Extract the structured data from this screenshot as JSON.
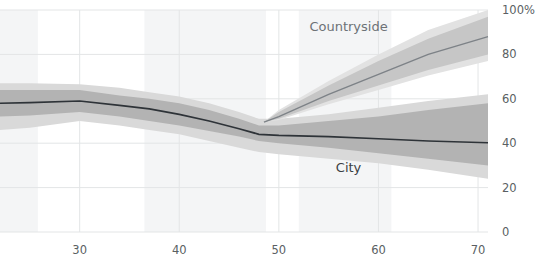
{
  "chart_data": {
    "type": "line",
    "title": "",
    "subtitle": "",
    "xlabel": "",
    "ylabel": "",
    "xlim": [
      22,
      71
    ],
    "ylim": [
      0,
      100
    ],
    "y_unit": "%",
    "grid": true,
    "legend_position": "inline-annotation",
    "x_ticks": [
      30,
      40,
      50,
      60,
      70
    ],
    "x_tick_labels": [
      "30",
      "40",
      "50",
      "60",
      "70"
    ],
    "y_ticks": [
      0,
      20,
      40,
      60,
      80,
      100
    ],
    "y_tick_labels": [
      "0",
      "20",
      "40",
      "60",
      "80",
      "100%"
    ],
    "background_bands": [
      {
        "x0": 22,
        "x1": 25.8
      },
      {
        "x0": 36.5,
        "x1": 48.7
      },
      {
        "x0": 52.0,
        "x1": 61.3
      }
    ],
    "series": [
      {
        "name": "City",
        "label": "City",
        "label_color": "#3b4044",
        "line_color": "#2e3338",
        "inner_band_color": "#b3b3b3",
        "outer_band_color": "#d9d9d9",
        "x": [
          22,
          25,
          30,
          34,
          37,
          40,
          43,
          46,
          48,
          50,
          55,
          60,
          65,
          71
        ],
        "values": [
          58,
          58.3,
          59,
          57,
          55.5,
          53,
          50,
          46.5,
          44,
          43.5,
          43,
          42,
          41,
          40.2
        ],
        "inner_low": [
          52,
          52.5,
          54,
          52,
          50,
          48,
          45.5,
          43,
          41,
          40,
          38,
          35.5,
          33,
          30
        ],
        "inner_high": [
          64,
          64,
          64,
          61.5,
          60,
          58,
          55,
          51,
          48,
          48,
          50,
          52,
          55,
          58
        ],
        "outer_low": [
          46,
          47,
          50,
          48,
          46,
          44,
          41,
          38,
          36,
          35,
          33,
          31,
          28,
          24
        ],
        "outer_high": [
          67,
          67,
          66.5,
          65,
          63,
          61,
          58,
          54,
          51,
          51,
          53,
          56,
          59,
          62
        ]
      },
      {
        "name": "Countryside",
        "label": "Countryside",
        "label_color": "#878c90",
        "line_color": "#7d8287",
        "inner_band_color": "#c6c6c6",
        "outer_band_color": "#e2e2e2",
        "x": [
          48.5,
          50,
          55,
          60,
          65,
          71
        ],
        "values": [
          49.5,
          52,
          62,
          71,
          80,
          88
        ],
        "inner_low": [
          49.5,
          51,
          59,
          66,
          73,
          80
        ],
        "inner_high": [
          49.5,
          54,
          66,
          77,
          87,
          97
        ],
        "outer_low": [
          49.5,
          50.5,
          57.5,
          64,
          70.5,
          77
        ],
        "outer_high": [
          49.5,
          55,
          68,
          80,
          91,
          100
        ]
      }
    ],
    "annotations": [
      {
        "name": "countryside-label",
        "text": "Countryside",
        "x": 57.0,
        "y": 90.5
      },
      {
        "name": "city-label",
        "text": "City",
        "x": 57.0,
        "y": 27.0
      }
    ]
  }
}
